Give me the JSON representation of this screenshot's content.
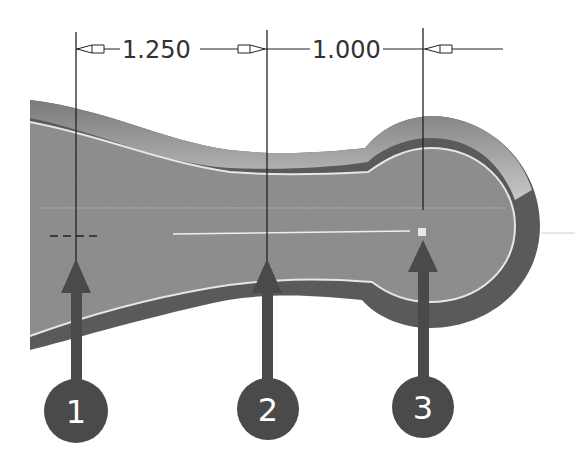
{
  "figure": {
    "colors": {
      "background": "#ffffff",
      "part_fill": "#8f8f8f",
      "part_edge_dark": "#555555",
      "part_edge_light": "#bdbdbd",
      "highlight_line": "#eeeeee",
      "dimension_line": "#222222",
      "callout_fill": "#4a4a4a",
      "callout_text": "#ffffff"
    }
  },
  "dimensions": [
    {
      "id": "dim-1",
      "value": "1.250",
      "from_x": 76,
      "to_x": 267
    },
    {
      "id": "dim-2",
      "value": "1.000",
      "from_x": 267,
      "to_x": 423
    }
  ],
  "extension_lines": [
    {
      "x": 76
    },
    {
      "x": 267
    },
    {
      "x": 423
    }
  ],
  "callouts": [
    {
      "number": "1",
      "x": 76,
      "target": "sketch-point-crosshair"
    },
    {
      "number": "2",
      "x": 267,
      "target": "centerline-midpoint"
    },
    {
      "number": "3",
      "x": 423,
      "target": "arc-center-point"
    }
  ]
}
